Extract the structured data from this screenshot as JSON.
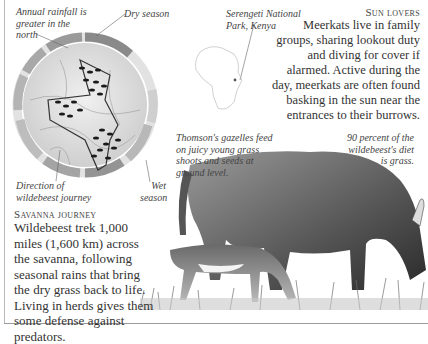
{
  "map": {
    "caption_rainfall": "Annual rainfall is greater in the north",
    "caption_dry": "Dry season",
    "caption_direction": "Direction of wildebeest journey",
    "caption_wet": "Wet season",
    "ring_color": "#8c8c8c",
    "ring_light_color": "#d6d6d6",
    "map_fill": "#e6e6e6"
  },
  "inset": {
    "caption": "Serengeti National Park, Kenya"
  },
  "sun_lovers": {
    "heading": "Sun lovers",
    "text": "Meerkats live in family groups, sharing lookout duty and diving for cover if alarmed. Active during the day, meerkats are often found basking in the sun near the entrances to their burrows."
  },
  "gazelle": {
    "caption": "Thomson's gazelles feed on juicy young grass shoots and seeds at ground level."
  },
  "wildebeest": {
    "caption": "90 percent of the wildebeest's diet is grass."
  },
  "savanna": {
    "heading": "Savanna journey",
    "text": "Wildebeest trek 1,000 miles (1,600 km) across the savanna, following seasonal rains that bring the dry grass back to life. Living in herds gives them some defense against predators."
  }
}
